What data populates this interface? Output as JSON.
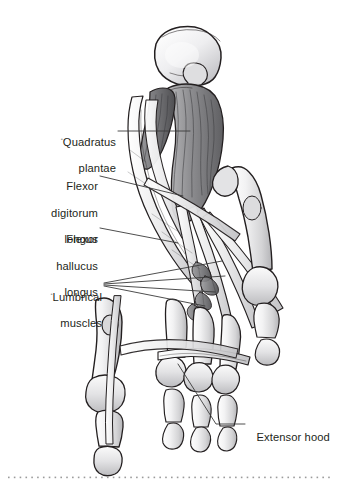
{
  "figure": {
    "view": "plantar (inferior) view of right foot, deep layer",
    "style": "grayscale medical illustration, pen-and-ink with gray wash",
    "background_color": "#ffffff",
    "ink_color": "#231f20",
    "leader_color": "#3a3a3a",
    "bone_fill": "#e9e9ea",
    "muscle_fill": "#9c9c9e",
    "muscle_dark": "#6e6e70",
    "tendon_fill": "#dcdcdd"
  },
  "labels": [
    {
      "id": "quadratus-plantae",
      "text": "Quadratus\nplantae",
      "line1": "Quadratus",
      "line2": "plantae",
      "align": "right",
      "marker": "•",
      "x": 46,
      "y": 120,
      "leader": [
        [
          118,
          131
        ],
        [
          190,
          131
        ]
      ]
    },
    {
      "id": "flexor-digitorum-longus",
      "text": "Flexor\ndigitorum\nlongus",
      "line1": "Flexor",
      "line2": "digitorum",
      "line3": "longus",
      "align": "right",
      "x": 46,
      "y": 167,
      "leader": [
        [
          100,
          176
        ],
        [
          183,
          196
        ]
      ]
    },
    {
      "id": "flexor-hallucis-longus",
      "text": "Flexor\nhallucus\nlongus",
      "line1": "Flexor",
      "line2": "hallucus",
      "line3": "longus",
      "align": "right",
      "x": 46,
      "y": 220,
      "leader": [
        [
          100,
          228
        ],
        [
          178,
          243
        ]
      ]
    },
    {
      "id": "lumbrical-muscles",
      "text": "Lumbrical\nmuscles",
      "line1": "Lumbrical",
      "line2": "muscles",
      "align": "right",
      "marker": "•",
      "x": 24,
      "y": 275,
      "leaders": [
        [
          [
            104,
            283
          ],
          [
            222,
            262
          ]
        ],
        [
          [
            104,
            284
          ],
          [
            224,
            276
          ]
        ],
        [
          [
            104,
            285
          ],
          [
            215,
            292
          ]
        ],
        [
          [
            104,
            286
          ],
          [
            205,
            305
          ]
        ]
      ]
    },
    {
      "id": "extensor-hood",
      "text": "Extensor hood",
      "line1": "Extensor hood",
      "align": "left",
      "x": 250,
      "y": 419,
      "leader": [
        [
          245,
          424
        ],
        [
          216,
          424
        ],
        [
          178,
          364
        ]
      ]
    }
  ],
  "anatomy_parts": [
    "calcaneus",
    "quadratus plantae",
    "flexor digitorum longus tendons",
    "flexor hallucis longus tendon",
    "lumbrical muscles",
    "extensor hood",
    "metatarsals",
    "proximal phalanges",
    "middle phalanges",
    "distal phalanges",
    "sesamoid bones"
  ],
  "footer": {
    "rule_style": "dotted",
    "rule_color": "#9b9b9b",
    "dot_count": 56
  }
}
